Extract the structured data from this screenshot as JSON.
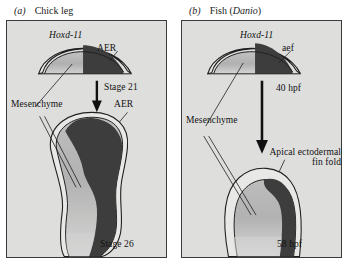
{
  "figure": {
    "type": "scientific-diagram",
    "colors": {
      "panel_background": "#dededd",
      "panel_border": "#3a3a3a",
      "mesenchyme_fill": "#b3b3b3",
      "expression_fill": "#3d3d3d",
      "ectoderm_fill": "#e8e8e7",
      "outline": "#1f1f1f",
      "text": "#111111",
      "page_background": "#ffffff"
    }
  },
  "panels": [
    {
      "letter": "(a)",
      "title": "Chick leg",
      "labels": {
        "gene": "Hoxd-11",
        "ectoderm_top": "AER",
        "ectoderm_bottom": "AER",
        "mesenchyme": "Mesenchyme",
        "stage_early": "Stage 21",
        "stage_late": "Stage 26"
      }
    },
    {
      "letter": "(b)",
      "title_prefix": "Fish (",
      "title_species": "Danio",
      "title_suffix": ")",
      "labels": {
        "gene": "Hoxd-11",
        "ectoderm_top": "aef",
        "ectoderm_bottom_line1": "Apical ectodermal",
        "ectoderm_bottom_line2": "fin fold",
        "mesenchyme": "Mesenchyme",
        "stage_early": "40 hpf",
        "stage_late": "58 hpf"
      }
    }
  ]
}
